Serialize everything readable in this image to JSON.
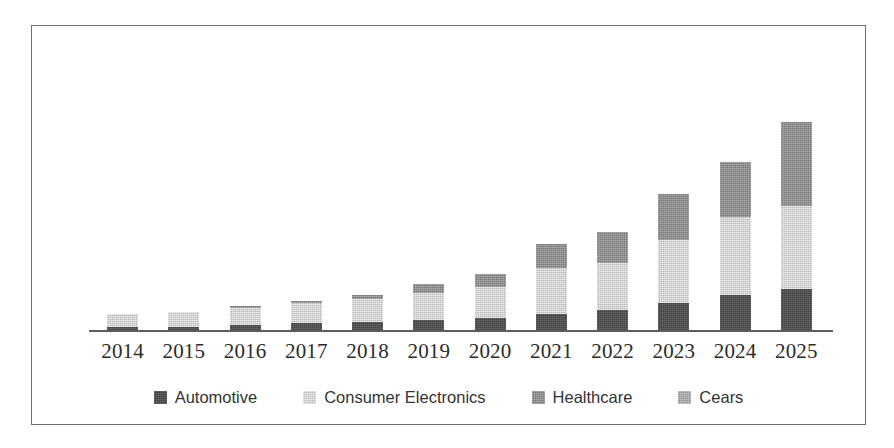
{
  "chart_data": {
    "type": "bar",
    "subtype": "stacked-bar",
    "title": "",
    "xlabel": "",
    "ylabel": "",
    "grid": false,
    "legend_position": "bottom",
    "axis_visible": {
      "x": true,
      "y": false
    },
    "ylim": [
      0,
      110
    ],
    "categories": [
      "2014",
      "2015",
      "2016",
      "2017",
      "2018",
      "2019",
      "2020",
      "2021",
      "2022",
      "2023",
      "2024",
      "2025"
    ],
    "series": [
      {
        "name": "Automotive",
        "color": "#4c4c4c",
        "values": [
          2,
          2,
          3,
          4,
          5,
          6,
          7,
          9,
          11,
          15,
          19,
          22
        ]
      },
      {
        "name": "Consumer Electronics",
        "color": "#d2d2d2",
        "values": [
          7,
          8,
          9,
          11,
          12,
          14,
          16,
          24,
          25,
          33,
          41,
          44
        ]
      },
      {
        "name": "Healthcare",
        "color": "#8a8a8a",
        "values": [
          0,
          0,
          1,
          1,
          2,
          5,
          7,
          13,
          16,
          24,
          29,
          44
        ]
      },
      {
        "name": "Cears",
        "color": "#a6a6a6",
        "values": [
          0,
          0,
          0,
          0,
          0,
          0,
          0,
          0,
          0,
          0,
          0,
          0
        ]
      }
    ],
    "totals": [
      9,
      10,
      13,
      16,
      19,
      25,
      30,
      46,
      52,
      72,
      89,
      110
    ]
  },
  "legend": {
    "items": [
      {
        "label": "Automotive",
        "color": "#4c4c4c",
        "key": "automotive"
      },
      {
        "label": "Consumer Electronics",
        "color": "#d2d2d2",
        "key": "consumer"
      },
      {
        "label": "Healthcare",
        "color": "#8a8a8a",
        "key": "healthcare"
      },
      {
        "label": "Cears",
        "color": "#a6a6a6",
        "key": "gears"
      }
    ]
  },
  "style": {
    "frame_color": "#6f6f6f",
    "axis_color": "#5d5d5d",
    "background": "#ffffff",
    "label_color": "#2c2c2c"
  }
}
